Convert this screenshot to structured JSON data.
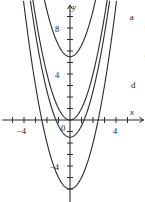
{
  "figure": {
    "axis_x_label": "x",
    "axis_y_label": "y",
    "origin_label": "0"
  },
  "chart_data": {
    "type": "line",
    "title": "",
    "xlabel": "x",
    "ylabel": "y",
    "xlim": [
      -5.9,
      6.4
    ],
    "ylim": [
      -7.2,
      10.0
    ],
    "xticks": [
      -5,
      -4,
      -3,
      -2,
      -1,
      1,
      2,
      3,
      4,
      5
    ],
    "yticks": [
      -6,
      -5,
      -4,
      -3,
      -2,
      -1,
      1,
      2,
      3,
      4,
      5,
      6,
      7,
      8,
      9
    ],
    "xtick_labels": [
      {
        "value": -4,
        "text": "−4"
      },
      {
        "value": 4,
        "text": "4"
      }
    ],
    "ytick_labels": [
      {
        "value": 8,
        "text": "8"
      },
      {
        "value": 4,
        "text": "4"
      },
      {
        "value": -4,
        "text": "−4"
      }
    ],
    "grid": false,
    "legend": "inline-curve-labels",
    "series": [
      {
        "name": "a",
        "label": "a",
        "form": "y = x^2 + 5.5",
        "a": 1,
        "k": 5.5,
        "label_x": 5.2,
        "label_y": 9.3,
        "color": "#2b2b2b"
      },
      {
        "name": "b",
        "label": "b",
        "form": "y = x^2",
        "a": 1,
        "k": 0,
        "label_x": 6.5,
        "label_y": 8.3,
        "color": "#2b2b2b"
      },
      {
        "name": "c",
        "label": "c",
        "form": "y = x^2 - 1.5",
        "a": 1,
        "k": -1.5,
        "label_x": 6.5,
        "label_y": 6.0,
        "color": "#2b2b2b"
      },
      {
        "name": "d",
        "label": "d",
        "form": "y = x^2 - 6",
        "a": 1,
        "k": -6,
        "label_x": 5.3,
        "label_y": 3.4,
        "color": "#2b2b2b"
      }
    ]
  }
}
